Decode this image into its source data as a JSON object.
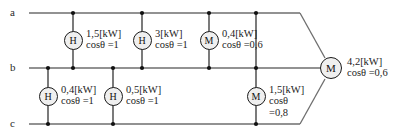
{
  "diagram": {
    "bus_labels": [
      {
        "id": "bus-a",
        "text": "a"
      },
      {
        "id": "bus-b",
        "text": "b"
      },
      {
        "id": "bus-c",
        "text": "c"
      }
    ],
    "loads": [
      {
        "id": "load-h1",
        "symbol": "H",
        "between": "a-b",
        "power": "1,5[kW]",
        "pf": "cos",
        "pf_sym": "θ",
        "pf_val": "=1",
        "lines": [
          "1,5[kW]",
          "cosθ =1"
        ]
      },
      {
        "id": "load-h2",
        "symbol": "H",
        "between": "a-b",
        "power": "3[kW]",
        "pf": "cos",
        "pf_sym": "θ",
        "pf_val": "=1",
        "lines": [
          "3[kW]",
          "cosθ =1"
        ]
      },
      {
        "id": "load-m1",
        "symbol": "M",
        "between": "a-b",
        "power": "0,4[kW]",
        "pf": "cos",
        "pf_sym": "θ",
        "pf_val": "=0,6",
        "lines": [
          "0,4[kW]",
          "cosθ =0,6"
        ]
      },
      {
        "id": "load-h3",
        "symbol": "H",
        "between": "b-c",
        "power": "0,4[kW]",
        "pf": "cos",
        "pf_sym": "θ",
        "pf_val": "=1",
        "lines": [
          "0,4[kW]",
          "cosθ =1"
        ]
      },
      {
        "id": "load-h4",
        "symbol": "H",
        "between": "b-c",
        "power": "0,5[kW]",
        "pf": "cos",
        "pf_sym": "θ",
        "pf_val": "=1",
        "lines": [
          "0,5[kW]",
          "cosθ =1"
        ]
      },
      {
        "id": "load-m2",
        "symbol": "M",
        "between": "b-c",
        "power": "1,5[kW]",
        "pf": "cos",
        "pf_sym": "θ",
        "pf_val": "=0,8",
        "lines": [
          "1,5[kW]",
          "cosθ",
          "=0,8"
        ]
      },
      {
        "id": "load-m-main",
        "symbol": "M",
        "between": "a-b-c",
        "power": "4,2[kW]",
        "pf": "cos",
        "pf_sym": "θ",
        "pf_val": "=0,6",
        "lines": [
          "4,2[kW]",
          "cosθ =0,6"
        ]
      }
    ],
    "colors": {
      "wire": "#6e6e6e",
      "node": "#111111",
      "device_fill": "#efefef",
      "device_stroke": "#1a1a1a",
      "text": "#1d1d1d"
    }
  }
}
